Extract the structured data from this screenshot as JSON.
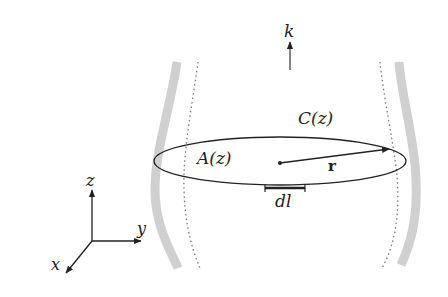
{
  "diagram": {
    "type": "physics-schematic",
    "labels": {
      "k": "k",
      "contour": "C(z)",
      "area": "A(z)",
      "radius": "r",
      "line_element": "dl",
      "axis_x": "x",
      "axis_y": "y",
      "axis_z": "z"
    },
    "colors": {
      "wall": "#d0d0d0",
      "dotted": "#777777",
      "line": "#222222",
      "background": "#ffffff"
    }
  }
}
